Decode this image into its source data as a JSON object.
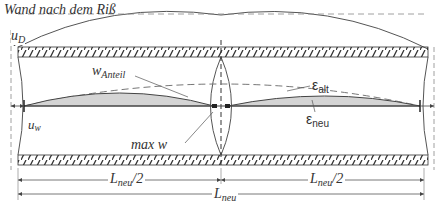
{
  "title": "Wand nach dem Riß",
  "labels": {
    "u_D": {
      "main": "u",
      "sub": "D"
    },
    "u_w": {
      "main": "u",
      "sub": "w"
    },
    "w_Anteil": {
      "main": "w",
      "sub": "Anteil"
    },
    "max_w": "max w",
    "eps_alt": {
      "main": "ε",
      "sub": "alt"
    },
    "eps_neu": {
      "main": "ε",
      "sub": "neu"
    },
    "L_half_left": {
      "main": "L",
      "sub": "neu",
      "suffix": "/2"
    },
    "L_half_right": {
      "main": "L",
      "sub": "neu",
      "suffix": "/2"
    },
    "L_total": {
      "main": "L",
      "sub": "neu"
    }
  },
  "colors": {
    "line": "#555555",
    "hatch": "#333333",
    "fill": "#d4d4d4",
    "text": "#333333"
  }
}
